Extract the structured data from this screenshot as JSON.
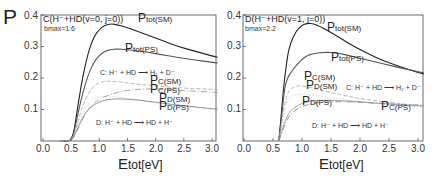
{
  "chart_data": [
    {
      "type": "line",
      "panel": "left",
      "title": "C(H⁻+HD(v=0, j=0))",
      "subtitle_b": "b",
      "subtitle_bmax": "max=1.6",
      "ylabel": "P",
      "xlabel_main": "E",
      "xlabel_rest": "tot[eV]",
      "xlim": [
        0.0,
        3.1
      ],
      "ylim": [
        0.0,
        0.4
      ],
      "xticks": [
        "0.0",
        "0.5",
        "1.0",
        "1.5",
        "2.0",
        "2.5",
        "3.0"
      ],
      "yticks": [
        "0.1",
        "0.2",
        "0.3",
        "0.4"
      ],
      "reaction_C": "C:  H⁻ + HD ⟶  H₂ + D⁻",
      "reaction_D": "D:  H⁻ + HD ⟶  HD + H⁻",
      "series": [
        {
          "name": "Ptot(SM)",
          "label_main": "P",
          "label_sub": "tot(SM)",
          "color": "#222222",
          "dash": "",
          "x": [
            0.3,
            0.45,
            0.5,
            0.55,
            0.6,
            0.7,
            0.8,
            0.9,
            1.0,
            1.1,
            1.2,
            1.3,
            1.5,
            1.8,
            2.1,
            2.4,
            2.7,
            3.0,
            3.1
          ],
          "y": [
            0.0,
            0.0,
            0.005,
            0.03,
            0.09,
            0.2,
            0.28,
            0.33,
            0.355,
            0.368,
            0.372,
            0.37,
            0.36,
            0.34,
            0.32,
            0.3,
            0.285,
            0.27,
            0.266
          ]
        },
        {
          "name": "Ptot(PS)",
          "label_main": "P",
          "label_sub": "tot(PS)",
          "color": "#555555",
          "dash": "",
          "x": [
            0.3,
            0.45,
            0.5,
            0.55,
            0.6,
            0.7,
            0.8,
            0.9,
            1.0,
            1.1,
            1.2,
            1.3,
            1.5,
            1.8,
            2.1,
            2.4,
            2.7,
            3.0,
            3.1
          ],
          "y": [
            0.0,
            0.0,
            0.004,
            0.025,
            0.07,
            0.15,
            0.21,
            0.25,
            0.272,
            0.285,
            0.29,
            0.292,
            0.29,
            0.283,
            0.275,
            0.265,
            0.257,
            0.25,
            0.248
          ]
        },
        {
          "name": "PC(SM)",
          "label_main": "P",
          "label_sub": "C(SM)",
          "color": "#aaaaaa",
          "dash": "4,2",
          "x": [
            0.3,
            0.45,
            0.5,
            0.55,
            0.6,
            0.7,
            0.8,
            0.9,
            1.0,
            1.1,
            1.2,
            1.4,
            1.7,
            2.0,
            2.3,
            2.6,
            3.0,
            3.1
          ],
          "y": [
            0.0,
            0.0,
            0.003,
            0.02,
            0.05,
            0.11,
            0.15,
            0.175,
            0.185,
            0.19,
            0.19,
            0.187,
            0.18,
            0.175,
            0.17,
            0.167,
            0.164,
            0.163
          ]
        },
        {
          "name": "PC(PS)",
          "label_main": "P",
          "label_sub": "C(PS)",
          "color": "#999999",
          "dash": "6,2,1,2",
          "x": [
            0.3,
            0.45,
            0.5,
            0.55,
            0.6,
            0.7,
            0.8,
            0.9,
            1.0,
            1.2,
            1.4,
            1.6,
            1.8,
            2.0,
            2.3,
            2.6,
            3.0,
            3.1
          ],
          "y": [
            0.0,
            0.0,
            0.002,
            0.012,
            0.03,
            0.07,
            0.1,
            0.12,
            0.133,
            0.148,
            0.158,
            0.163,
            0.165,
            0.165,
            0.162,
            0.159,
            0.155,
            0.154
          ]
        },
        {
          "name": "PD(SM)",
          "label_main": "P",
          "label_sub": "D(SM)",
          "color": "#bbbbbb",
          "dash": "1,2",
          "x": [
            0.3,
            0.45,
            0.5,
            0.55,
            0.6,
            0.7,
            0.8,
            0.9,
            1.0,
            1.1,
            1.2,
            1.4,
            1.7,
            2.0,
            2.3,
            2.6,
            3.0,
            3.1
          ],
          "y": [
            0.0,
            0.0,
            0.003,
            0.02,
            0.045,
            0.09,
            0.12,
            0.135,
            0.14,
            0.142,
            0.142,
            0.138,
            0.13,
            0.122,
            0.115,
            0.108,
            0.1,
            0.098
          ]
        },
        {
          "name": "PD(PS)",
          "label_main": "P",
          "label_sub": "D(PS)",
          "color": "#888888",
          "dash": "",
          "x": [
            0.3,
            0.45,
            0.5,
            0.55,
            0.6,
            0.7,
            0.8,
            0.9,
            1.0,
            1.1,
            1.2,
            1.4,
            1.7,
            2.0,
            2.3,
            2.6,
            3.0,
            3.1
          ],
          "y": [
            0.0,
            0.0,
            0.002,
            0.015,
            0.035,
            0.075,
            0.1,
            0.115,
            0.124,
            0.13,
            0.133,
            0.134,
            0.13,
            0.123,
            0.116,
            0.11,
            0.103,
            0.101
          ]
        }
      ]
    },
    {
      "type": "line",
      "panel": "right",
      "title": "D(H⁻+HD(v=1, j=0))",
      "subtitle_b": "b",
      "subtitle_bmax": "max=2.2",
      "ylabel": "",
      "xlabel_main": "E",
      "xlabel_rest": "tot[eV]",
      "xlim": [
        0.0,
        3.1
      ],
      "ylim": [
        0.0,
        0.4
      ],
      "xticks": [
        "0.0",
        "0.5",
        "1.0",
        "1.5",
        "2.0",
        "2.5",
        "3.0"
      ],
      "yticks": [
        "0.1",
        "0.2",
        "0.3",
        "0.4"
      ],
      "reaction_C": "C:  H⁻ + HD ⟶  H₂ + D⁻",
      "reaction_D": "D:  H⁻ + HD ⟶  HD + H⁻",
      "series": [
        {
          "name": "Ptot(SM)",
          "label_main": "P",
          "label_sub": "tot(SM)",
          "color": "#222222",
          "dash": "",
          "x": [
            0.6,
            0.65,
            0.7,
            0.75,
            0.8,
            0.9,
            1.0,
            1.1,
            1.2,
            1.3,
            1.5,
            1.8,
            2.1,
            2.4,
            2.7,
            3.0,
            3.1
          ],
          "y": [
            0.0,
            0.1,
            0.2,
            0.27,
            0.31,
            0.35,
            0.368,
            0.374,
            0.372,
            0.365,
            0.345,
            0.31,
            0.28,
            0.255,
            0.235,
            0.218,
            0.213
          ]
        },
        {
          "name": "Ptot(PS)",
          "label_main": "P",
          "label_sub": "tot(PS)",
          "color": "#555555",
          "dash": "",
          "x": [
            0.6,
            0.65,
            0.7,
            0.75,
            0.8,
            0.9,
            1.0,
            1.1,
            1.2,
            1.4,
            1.6,
            1.8,
            2.1,
            2.4,
            2.7,
            3.0,
            3.1
          ],
          "y": [
            0.0,
            0.08,
            0.17,
            0.2,
            0.215,
            0.24,
            0.26,
            0.272,
            0.278,
            0.282,
            0.28,
            0.272,
            0.258,
            0.245,
            0.232,
            0.22,
            0.216
          ]
        },
        {
          "name": "PC(SM)",
          "label_main": "P",
          "label_sub": "C(SM)",
          "color": "#aaaaaa",
          "dash": "4,2",
          "x": [
            0.6,
            0.65,
            0.7,
            0.75,
            0.8,
            0.9,
            1.0,
            1.2,
            1.4,
            1.7,
            2.0,
            2.3,
            2.6,
            3.0,
            3.1
          ],
          "y": [
            0.0,
            0.06,
            0.12,
            0.15,
            0.165,
            0.175,
            0.175,
            0.168,
            0.158,
            0.145,
            0.135,
            0.127,
            0.12,
            0.113,
            0.111
          ]
        },
        {
          "name": "PD(SM)",
          "label_main": "P",
          "label_sub": "D(SM)",
          "color": "#bbbbbb",
          "dash": "1,2",
          "x": [
            0.6,
            0.65,
            0.7,
            0.75,
            0.8,
            0.9,
            1.0,
            1.2,
            1.4,
            1.7,
            2.0,
            2.3,
            2.6,
            3.0,
            3.1
          ],
          "y": [
            0.0,
            0.05,
            0.1,
            0.13,
            0.142,
            0.148,
            0.148,
            0.145,
            0.14,
            0.132,
            0.125,
            0.119,
            0.114,
            0.108,
            0.107
          ]
        },
        {
          "name": "PD(PS)",
          "label_main": "P",
          "label_sub": "D(PS)",
          "color": "#999999",
          "dash": "",
          "x": [
            0.6,
            0.65,
            0.7,
            0.75,
            0.8,
            0.9,
            1.0,
            1.2,
            1.4,
            1.7,
            2.0,
            2.3,
            2.6,
            3.0,
            3.1
          ],
          "y": [
            0.0,
            0.03,
            0.06,
            0.08,
            0.095,
            0.11,
            0.12,
            0.128,
            0.13,
            0.128,
            0.124,
            0.12,
            0.116,
            0.112,
            0.111
          ]
        },
        {
          "name": "PC(PS)",
          "label_main": "P",
          "label_sub": "C(PS)",
          "color": "#888888",
          "dash": "6,2,1,2",
          "x": [
            0.6,
            0.65,
            0.7,
            0.75,
            0.8,
            0.9,
            1.0,
            1.2,
            1.4,
            1.7,
            2.0,
            2.3,
            2.6,
            3.0,
            3.1
          ],
          "y": [
            0.0,
            0.025,
            0.05,
            0.07,
            0.085,
            0.1,
            0.11,
            0.12,
            0.124,
            0.125,
            0.123,
            0.12,
            0.117,
            0.114,
            0.113
          ]
        }
      ]
    }
  ]
}
